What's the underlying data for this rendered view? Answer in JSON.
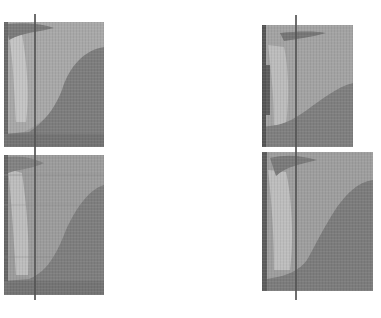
{
  "figure": {
    "colors": {
      "background": "#ffffff",
      "light_region": "#b9b9b9",
      "mid_region": "#8e8e8e",
      "dark_region": "#6f6f6f",
      "edge_dark": "#5a5a5a",
      "line": "#555555"
    },
    "panels": [
      {
        "id": "top-left",
        "x": 4,
        "y": 22,
        "w": 100,
        "h": 125
      },
      {
        "id": "bottom-left",
        "x": 4,
        "y": 155,
        "w": 100,
        "h": 140
      },
      {
        "id": "top-right",
        "x": 262,
        "y": 25,
        "w": 91,
        "h": 122
      },
      {
        "id": "bottom-right",
        "x": 262,
        "y": 152,
        "w": 111,
        "h": 139
      }
    ],
    "lines": [
      {
        "id": "left-line",
        "x": 35,
        "y1": 14,
        "y2": 300
      },
      {
        "id": "right-line",
        "x": 296,
        "y1": 15,
        "y2": 300
      }
    ]
  }
}
